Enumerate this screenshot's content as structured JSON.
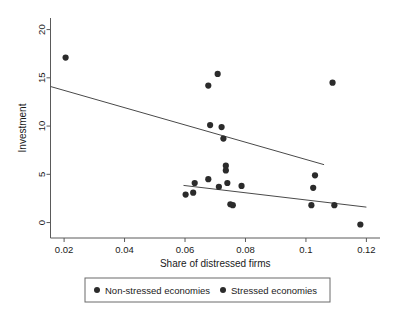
{
  "chart_data": {
    "type": "scatter",
    "title": "",
    "xlabel": "Share of distressed firms",
    "ylabel": "Investment",
    "xlim": [
      0.0155,
      0.1245
    ],
    "ylim": [
      -1.6,
      21.2
    ],
    "xticks": [
      0.02,
      0.04,
      0.06,
      0.08,
      0.1,
      0.12
    ],
    "xtick_labels": [
      "0.02",
      "0.04",
      "0.06",
      "0.08",
      "0.1",
      "0.12"
    ],
    "yticks": [
      0,
      5,
      10,
      15,
      20
    ],
    "ytick_labels": [
      "0",
      "5",
      "10",
      "15",
      "20"
    ],
    "grid": false,
    "legend_position": "bottom-outside",
    "marker_color": "#2b2b2b",
    "line_color": "#4a4a4a",
    "series": [
      {
        "name": "Non-stressed economies",
        "marker": "filled-circle",
        "color": "#2b2b2b",
        "points": [
          {
            "x": 0.0205,
            "y": 17.1
          },
          {
            "x": 0.0708,
            "y": 15.4
          },
          {
            "x": 0.0677,
            "y": 14.2
          },
          {
            "x": 0.1088,
            "y": 14.5
          },
          {
            "x": 0.0683,
            "y": 10.1
          },
          {
            "x": 0.0721,
            "y": 9.9
          },
          {
            "x": 0.0727,
            "y": 8.7
          },
          {
            "x": 0.0735,
            "y": 5.9
          },
          {
            "x": 0.0735,
            "y": 5.4
          },
          {
            "x": 0.103,
            "y": 4.9
          }
        ],
        "fit_line": {
          "x1": 0.0155,
          "y1": 14.1,
          "x2": 0.106,
          "y2": 6.0
        }
      },
      {
        "name": "Stressed economies",
        "marker": "filled-circle",
        "color": "#2b2b2b",
        "points": [
          {
            "x": 0.0632,
            "y": 4.1
          },
          {
            "x": 0.0677,
            "y": 4.5
          },
          {
            "x": 0.074,
            "y": 4.1
          },
          {
            "x": 0.0787,
            "y": 3.8
          },
          {
            "x": 0.0712,
            "y": 3.7
          },
          {
            "x": 0.1024,
            "y": 3.6
          },
          {
            "x": 0.0627,
            "y": 3.1
          },
          {
            "x": 0.0602,
            "y": 2.9
          },
          {
            "x": 0.075,
            "y": 1.9
          },
          {
            "x": 0.0758,
            "y": 1.8
          },
          {
            "x": 0.1018,
            "y": 1.8
          },
          {
            "x": 0.1094,
            "y": 1.8
          },
          {
            "x": 0.118,
            "y": -0.2
          }
        ],
        "fit_line": {
          "x1": 0.0595,
          "y1": 3.85,
          "x2": 0.12,
          "y2": 1.6
        }
      }
    ]
  },
  "legend": {
    "entries": [
      {
        "label": "Non-stressed economies",
        "marker_color": "#2b2b2b"
      },
      {
        "label": "Stressed economies",
        "marker_color": "#2b2b2b"
      }
    ]
  }
}
